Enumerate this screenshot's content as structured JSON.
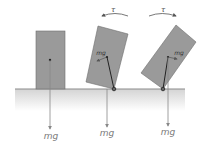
{
  "diagram": {
    "colors": {
      "block_fill": "#9a9a9a",
      "block_stroke": "#6e6e6e",
      "ground_line": "#8a8a8a",
      "ground_shade": "#d6d6d6",
      "arrow": "#888888",
      "lever": "#222222",
      "label": "#777777"
    },
    "blocks": [
      {
        "id": "upright",
        "gravity_label": "mg"
      },
      {
        "id": "tipped-restoring",
        "gravity_label": "mg",
        "inner_label": "mg",
        "torque_label": "τ",
        "torque_direction": "counterclockwise"
      },
      {
        "id": "tipped-overturning",
        "gravity_label": "mg",
        "inner_label": "mg",
        "torque_label": "τ",
        "torque_direction": "clockwise"
      }
    ]
  }
}
